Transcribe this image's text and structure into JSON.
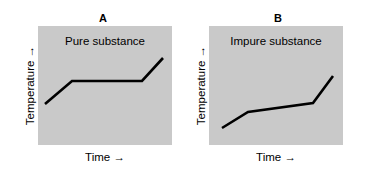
{
  "figure": {
    "width": 365,
    "height": 181,
    "background_color": "#ffffff",
    "plot_fill_color": "#c9c9c9",
    "line_color": "#000000"
  },
  "panels": [
    {
      "title": "A",
      "in_plot_label": "Pure substance",
      "x_axis_label": "Time →",
      "y_axis_label": "Temperature →",
      "polyline_points": "7 78, 34 55, 104 55, 125 32"
    },
    {
      "title": "B",
      "in_plot_label": "Impure substance",
      "x_axis_label": "Time →",
      "y_axis_label": "Temperature →",
      "polyline_points": "13 102, 39 86, 104 77, 124 50"
    }
  ],
  "chart_data": [
    {
      "type": "line",
      "title": "A",
      "annotation": "Pure substance",
      "xlabel": "Time →",
      "ylabel": "Temperature →",
      "grid": false,
      "legend": "none",
      "axis_ticks": "none",
      "xlim": [
        0,
        1
      ],
      "ylim": [
        0,
        1
      ],
      "series": [
        {
          "name": "Pure substance heating curve",
          "x": [
            0.05,
            0.25,
            0.78,
            0.93
          ],
          "y": [
            0.34,
            0.54,
            0.54,
            0.73
          ],
          "description": "Rises, then a flat plateau at constant temperature during phase change, then rises again"
        }
      ]
    },
    {
      "type": "line",
      "title": "B",
      "annotation": "Impure substance",
      "xlabel": "Time →",
      "ylabel": "Temperature →",
      "grid": false,
      "legend": "none",
      "axis_ticks": "none",
      "xlim": [
        0,
        1
      ],
      "ylim": [
        0,
        1
      ],
      "series": [
        {
          "name": "Impure substance heating curve",
          "x": [
            0.1,
            0.29,
            0.78,
            0.93
          ],
          "y": [
            0.14,
            0.28,
            0.35,
            0.58
          ],
          "description": "Rises, then a gently sloping segment during phase change, then rises steeply"
        }
      ]
    }
  ]
}
